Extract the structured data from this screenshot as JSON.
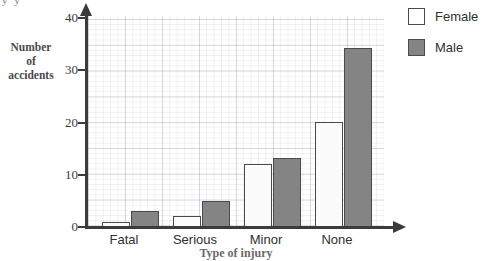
{
  "chart_data": {
    "type": "bar",
    "title": "",
    "categories": [
      "Fatal",
      "Serious",
      "Minor",
      "None"
    ],
    "series": [
      {
        "name": "Female",
        "values": [
          1,
          2,
          12,
          20
        ],
        "color": "#ffffff"
      },
      {
        "name": "Male",
        "values": [
          3,
          5,
          13,
          34
        ],
        "color": "#848484"
      }
    ],
    "xlabel": "Type of injury",
    "ylabel": "Number of accidents",
    "ylabel_lines": [
      "Number",
      "of",
      "accidents"
    ],
    "ylim": [
      0,
      40
    ],
    "yticks": [
      0,
      10,
      20,
      30,
      40
    ],
    "ytick_labels": [
      "0",
      "10",
      "20",
      "30",
      "40"
    ],
    "grid": true,
    "legend_position": "right",
    "legend": [
      {
        "label": "Female",
        "swatch": "white"
      },
      {
        "label": "Male",
        "swatch": "gray"
      }
    ]
  },
  "axis": {
    "y_label_line1": "Number",
    "y_label_line2": "of",
    "y_label_line3": "accidents",
    "x_title": "Type of injury",
    "y_tick_0": "0",
    "y_tick_1": "10",
    "y_tick_2": "20",
    "y_tick_3": "30",
    "y_tick_4": "40"
  },
  "categories": {
    "c0": "Fatal",
    "c1": "Serious",
    "c2": "Minor",
    "c3": "None"
  },
  "legend": {
    "female": "Female",
    "male": "Male"
  },
  "artifact": {
    "top_left_clipped": "y y"
  }
}
